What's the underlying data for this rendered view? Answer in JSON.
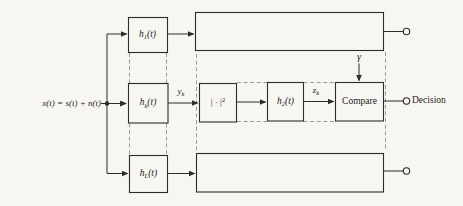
{
  "colors": {
    "paper": "#f7f6f2",
    "ink": "#2e2c29",
    "dash": "#9d9a94",
    "text": "#1f1d1a"
  },
  "diagram": {
    "input_label": "x(t) = s(t) + n(t)",
    "branches": {
      "filter_1": {
        "base": "h",
        "sub": "1",
        "arg": "(t)"
      },
      "filter_k": {
        "base": "h",
        "sub": "k",
        "arg": "(t)"
      },
      "filter_L": {
        "base": "h",
        "sub": "L",
        "arg": "(t)"
      }
    },
    "middle_chain": {
      "y_k": {
        "base": "y",
        "sub": "k"
      },
      "squarer": {
        "body": "| · |",
        "sup": "2"
      },
      "filter_2": {
        "base": "h",
        "sub": "2",
        "arg": "(t)"
      },
      "z_k": {
        "base": "z",
        "sub": "k"
      },
      "compare": "Compare",
      "threshold": "γ"
    },
    "output_label": "Decision"
  }
}
